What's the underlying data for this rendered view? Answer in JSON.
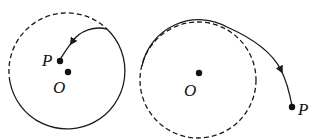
{
  "colors": {
    "stroke": "#1a1a1a",
    "background": "#ffffff"
  },
  "diagrams": [
    {
      "name": "left-diagram",
      "description": "Trajectory spiralling inward from the circle toward point P near the center O",
      "labels": {
        "point_p": "P",
        "center_o": "O"
      }
    },
    {
      "name": "right-diagram",
      "description": "Trajectory leaving the circle tangentially and moving outward to point P",
      "labels": {
        "point_p": "P",
        "center_o": "O"
      }
    }
  ]
}
